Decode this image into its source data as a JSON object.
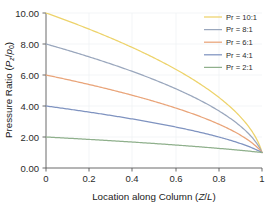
{
  "chart_data": {
    "type": "line",
    "title": "",
    "xlabel": "Location along Column (Z/L)",
    "xlabel_plain": "Location along Column (Z/L)",
    "ylabel": "Pressure Ratio (Pz/p0)",
    "ylabel_plain": "Pressure Ratio (Pz/p0)",
    "xlim": [
      0,
      1
    ],
    "ylim": [
      0,
      10
    ],
    "xticks": [
      "0",
      "0.2",
      "0.4",
      "0.6",
      "0.8",
      "1"
    ],
    "xtick_values": [
      0,
      0.2,
      0.4,
      0.6,
      0.8,
      1
    ],
    "yticks": [
      "0.00",
      "2.00",
      "4.00",
      "6.00",
      "8.00",
      "10.00"
    ],
    "ytick_values": [
      0,
      2,
      4,
      6,
      8,
      10
    ],
    "grid": true,
    "legend_position": "upper right",
    "x": [
      0,
      0.05,
      0.1,
      0.15,
      0.2,
      0.25,
      0.3,
      0.35,
      0.4,
      0.45,
      0.5,
      0.55,
      0.6,
      0.65,
      0.7,
      0.75,
      0.8,
      0.85,
      0.9,
      0.95,
      1
    ],
    "series": [
      {
        "name": "Pr = 10:1",
        "pressure_ratio": 10,
        "color": "#edd36b",
        "values": [
          10.0,
          9.75,
          9.5,
          9.24,
          8.97,
          8.7,
          8.42,
          8.13,
          7.83,
          7.52,
          7.11,
          6.86,
          6.51,
          6.14,
          5.75,
          5.33,
          4.87,
          4.36,
          3.78,
          3.07,
          1.0
        ]
      },
      {
        "name": "Pr = 8:1",
        "pressure_ratio": 8,
        "color": "#9aa7bd",
        "values": [
          8.0,
          7.8,
          7.6,
          7.39,
          7.18,
          6.96,
          6.73,
          6.5,
          6.26,
          6.01,
          5.75,
          5.48,
          5.2,
          4.91,
          4.6,
          4.27,
          3.91,
          3.51,
          3.05,
          2.5,
          1.0
        ]
      },
      {
        "name": "Pr = 6:1",
        "pressure_ratio": 6,
        "color": "#e9a479",
        "values": [
          6.0,
          5.85,
          5.7,
          5.55,
          5.39,
          5.22,
          5.06,
          4.88,
          4.7,
          4.52,
          4.32,
          4.12,
          3.91,
          3.69,
          3.46,
          3.22,
          2.96,
          2.67,
          2.34,
          1.96,
          1.0
        ]
      },
      {
        "name": "Pr = 4:1",
        "pressure_ratio": 4,
        "color": "#7f93c0",
        "values": [
          4.0,
          3.91,
          3.81,
          3.71,
          3.61,
          3.5,
          3.39,
          3.28,
          3.16,
          3.04,
          2.92,
          2.79,
          2.65,
          2.51,
          2.36,
          2.2,
          2.03,
          1.85,
          1.64,
          1.4,
          1.0
        ]
      },
      {
        "name": "Pr = 2:1",
        "pressure_ratio": 2,
        "color": "#8fb08c",
        "values": [
          2.0,
          1.96,
          1.92,
          1.89,
          1.85,
          1.8,
          1.76,
          1.72,
          1.67,
          1.63,
          1.58,
          1.53,
          1.48,
          1.43,
          1.38,
          1.32,
          1.26,
          1.2,
          1.14,
          1.07,
          1.0
        ]
      }
    ]
  },
  "legend": {
    "entries": [
      {
        "label": "Pr = 10:1",
        "color": "#edd36b"
      },
      {
        "label": "Pr = 8:1",
        "color": "#9aa7bd"
      },
      {
        "label": "Pr = 6:1",
        "color": "#e9a479"
      },
      {
        "label": "Pr = 4:1",
        "color": "#7f93c0"
      },
      {
        "label": "Pr = 2:1",
        "color": "#8fb08c"
      }
    ]
  },
  "axes": {
    "y_title_parts": {
      "prefix": "Pressure Ratio (",
      "p_upper": "P",
      "z_sub": "z",
      "slash": "/",
      "p_lower": "p",
      "zero_sub": "0",
      "suffix": ")"
    },
    "x_title_parts": {
      "prefix": "Location along Column (",
      "z": "Z",
      "slash": "/",
      "l": "L",
      "suffix": ")"
    }
  }
}
